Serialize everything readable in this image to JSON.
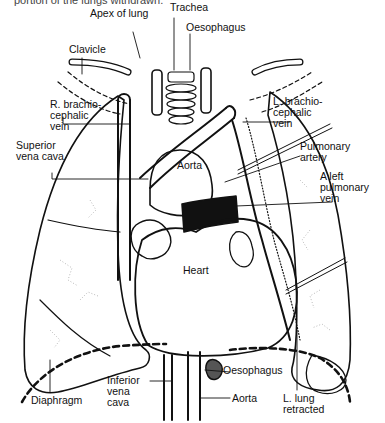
{
  "caption": {
    "partial_text": "portion of the lungs withdrawn."
  },
  "labels": {
    "trachea": "Trachea",
    "apex_of_lung": "Apex of lung",
    "oesophagus_top": "Oesophagus",
    "clavicle": "Clavicle",
    "r_brachiocephalic_vein": "R. brachio-\ncephalic\nvein",
    "l_brachiocephalic_vein": "L. brachio-\ncephalic\nvein",
    "superior_vena_cava": "Superior\nvena cava",
    "pulmonary_artery": "Pulmonary\nartery",
    "aorta_top": "Aorta",
    "left_pulmonary_vein": "A left\npulmonary\nvein",
    "heart": "Heart",
    "oesophagus_bottom": "Oesophagus",
    "diaphragm": "Diaphragm",
    "inferior_vena_cava": "Inferior\nvena\ncava",
    "aorta_bottom": "Aorta",
    "l_lung_retracted": "L. lung\nretracted"
  },
  "colors": {
    "ink": "#111111",
    "paper": "#ffffff",
    "stipple": "#8a8a8a"
  }
}
